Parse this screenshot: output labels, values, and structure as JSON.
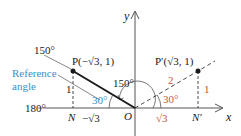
{
  "diagram": {
    "axes": {
      "x_label": "x",
      "y_label": "y",
      "origin_label": "O"
    },
    "angle_labels": {
      "angle_150_terminal": "150°",
      "angle_180": "180°",
      "angle_150_arc": "150°",
      "ref_angle_left": "30°",
      "ref_angle_right": "30°"
    },
    "points": {
      "P": {
        "label": "P(−√3, 1)"
      },
      "P_prime": {
        "label": "P′(√3, 1)"
      },
      "N": {
        "label": "N"
      },
      "N_prime": {
        "label": "N′"
      }
    },
    "segment_labels": {
      "left_height": "1",
      "left_base": "−√3",
      "right_height": "1",
      "right_base": "√3",
      "right_hyp": "2"
    },
    "annotation": {
      "line1": "Reference",
      "line2": "angle"
    },
    "colors": {
      "black": "#1a1a1a",
      "blue": "#3a8fc8",
      "red": "#c8553d",
      "gray_axis": "#555555"
    }
  }
}
